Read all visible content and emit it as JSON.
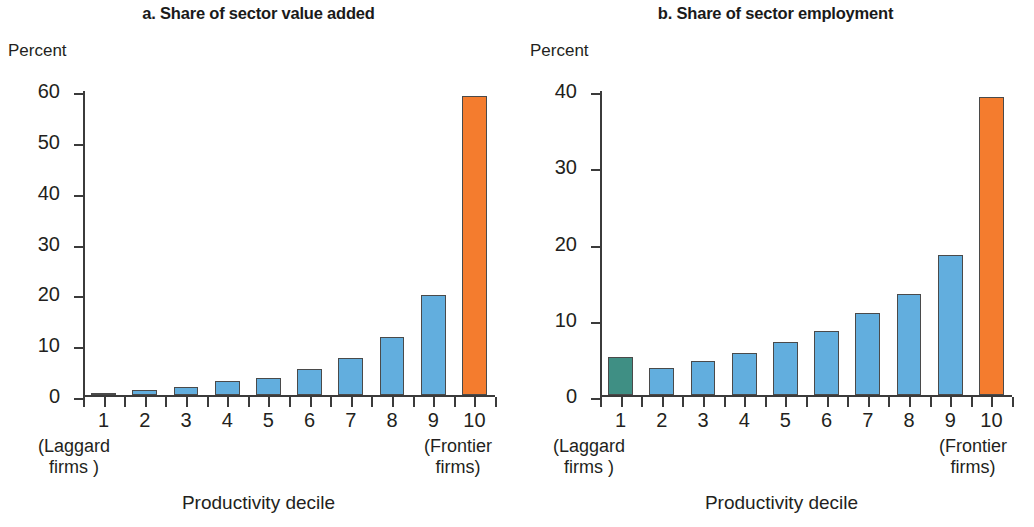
{
  "figure": {
    "panels": [
      {
        "id": "a",
        "title": "a. Share of sector value added",
        "y_unit_label": "Percent",
        "x_axis_title": "Productivity decile",
        "left_endcap": "(Laggard\nfirms )",
        "left_endcap_line1": "(Laggard",
        "left_endcap_line2": "firms )",
        "right_endcap_line1": "(Frontier",
        "right_endcap_line2": "firms)",
        "y_ticks": [
          "0",
          "10",
          "20",
          "30",
          "40",
          "50",
          "60"
        ],
        "x_ticks": [
          "1",
          "2",
          "3",
          "4",
          "5",
          "6",
          "7",
          "8",
          "9",
          "10"
        ]
      },
      {
        "id": "b",
        "title": "b. Share of sector employment",
        "y_unit_label": "Percent",
        "x_axis_title": "Productivity decile",
        "left_endcap_line1": "(Laggard",
        "left_endcap_line2": "firms )",
        "right_endcap_line1": "(Frontier",
        "right_endcap_line2": "firms)",
        "y_ticks": [
          "0",
          "10",
          "20",
          "30",
          "40"
        ],
        "x_ticks": [
          "1",
          "2",
          "3",
          "4",
          "5",
          "6",
          "7",
          "8",
          "9",
          "10"
        ]
      }
    ],
    "colors": {
      "blue": "#62AEDE",
      "orange": "#F47C2E",
      "teal": "#3F8F84",
      "outline": "#4a4a4a",
      "axis": "#3b3b3b",
      "text": "#231f20"
    }
  },
  "chart_data": [
    {
      "type": "bar",
      "title": "a. Share of sector value added",
      "xlabel": "Productivity decile",
      "ylabel": "Percent",
      "ylim": [
        0,
        60
      ],
      "yticks": [
        0,
        10,
        20,
        30,
        40,
        50,
        60
      ],
      "grid": false,
      "legend": "none",
      "categories": [
        "1",
        "2",
        "3",
        "4",
        "5",
        "6",
        "7",
        "8",
        "9",
        "10"
      ],
      "category_notes": {
        "1": "(Laggard firms )",
        "10": "(Frontier firms)"
      },
      "values": [
        0.3,
        1.0,
        1.5,
        2.8,
        3.4,
        5.1,
        7.3,
        11.5,
        19.7,
        58.8
      ],
      "bar_colors": [
        "#3F8F84",
        "#62AEDE",
        "#62AEDE",
        "#62AEDE",
        "#62AEDE",
        "#62AEDE",
        "#62AEDE",
        "#62AEDE",
        "#62AEDE",
        "#F47C2E"
      ]
    },
    {
      "type": "bar",
      "title": "b. Share of sector employment",
      "xlabel": "Productivity decile",
      "ylabel": "Percent",
      "ylim": [
        0,
        40
      ],
      "yticks": [
        0,
        10,
        20,
        30,
        40
      ],
      "grid": false,
      "legend": "none",
      "categories": [
        "1",
        "2",
        "3",
        "4",
        "5",
        "6",
        "7",
        "8",
        "9",
        "10"
      ],
      "category_notes": {
        "1": "(Laggard firms )",
        "10": "(Frontier firms)"
      },
      "values": [
        5.0,
        3.6,
        4.5,
        5.5,
        6.9,
        8.4,
        10.8,
        13.2,
        18.4,
        39.1
      ],
      "bar_colors": [
        "#3F8F84",
        "#62AEDE",
        "#62AEDE",
        "#62AEDE",
        "#62AEDE",
        "#62AEDE",
        "#62AEDE",
        "#62AEDE",
        "#62AEDE",
        "#F47C2E"
      ]
    }
  ]
}
